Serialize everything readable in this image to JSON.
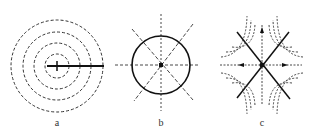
{
  "figure": {
    "panels": [
      {
        "id": "a",
        "label": "a",
        "description": "Concentric dashed circles with a solid radial line from center to the right"
      },
      {
        "id": "b",
        "label": "b",
        "description": "Solid circle with dashed lines through center (horizontal, vertical, two diagonals)"
      },
      {
        "id": "c",
        "label": "c",
        "description": "Two solid crossing diagonal lines with dashed hyperbolic curves in four quadrants and dashed axes"
      }
    ]
  },
  "colors": {
    "stroke": "#222222",
    "background": "#ffffff"
  }
}
